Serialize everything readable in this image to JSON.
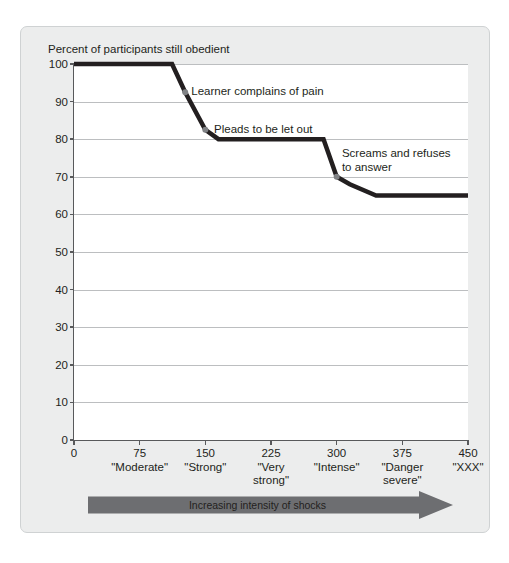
{
  "chart_data": {
    "type": "line",
    "title": "Percent of participants still obedient",
    "xlabel": "Increasing intensity of shocks",
    "ylabel": "Percent of participants still obedient",
    "xlim": [
      0,
      450
    ],
    "ylim": [
      0,
      100
    ],
    "grid": true,
    "legend": "none",
    "x_ticks": [
      0,
      75,
      150,
      225,
      300,
      375,
      450
    ],
    "x_tick_labels": [
      "0",
      "75",
      "150",
      "225",
      "300",
      "375",
      "450"
    ],
    "x_category_labels": [
      "",
      "\"Moderate\"",
      "\"Strong\"",
      "\"Very\nstrong\"",
      "\"Intense\"",
      "\"Danger\nsevere\"",
      "\"XXX\""
    ],
    "y_ticks": [
      0,
      10,
      20,
      30,
      40,
      50,
      60,
      70,
      80,
      90,
      100
    ],
    "y_tick_labels": [
      "0",
      "10",
      "20",
      "30",
      "40",
      "50",
      "60",
      "70",
      "80",
      "90",
      "100"
    ],
    "series": [
      {
        "name": "Percent still obedient",
        "color": "#231f20",
        "points": [
          {
            "x": 0,
            "y": 100
          },
          {
            "x": 112,
            "y": 100
          },
          {
            "x": 127,
            "y": 92.5
          },
          {
            "x": 150,
            "y": 82.5
          },
          {
            "x": 165,
            "y": 80
          },
          {
            "x": 285,
            "y": 80
          },
          {
            "x": 300,
            "y": 70
          },
          {
            "x": 315,
            "y": 68
          },
          {
            "x": 345,
            "y": 65
          },
          {
            "x": 450,
            "y": 65
          }
        ]
      }
    ],
    "markers": [
      {
        "x": 127,
        "y": 92.5,
        "color": "#808285"
      },
      {
        "x": 150,
        "y": 82.5,
        "color": "#808285"
      },
      {
        "x": 300,
        "y": 70,
        "color": "#808285"
      }
    ],
    "annotations": [
      {
        "text": "Learner complains of pain",
        "x": 134,
        "y": 92.5
      },
      {
        "text": "Pleads to be let out",
        "x": 160,
        "y": 82.5
      },
      {
        "text": "Screams and refuses\nto answer",
        "x": 306,
        "y": 76
      }
    ]
  },
  "colors": {
    "panel_background": "#eceded",
    "plot_background": "#ffffff",
    "axis": "#58595b",
    "gridline": "#bcbec0",
    "line": "#231f20",
    "marker": "#808285",
    "arrow": "#6d6e71",
    "text": "#231f20"
  },
  "arrow": {
    "label": "Increasing intensity of shocks"
  }
}
